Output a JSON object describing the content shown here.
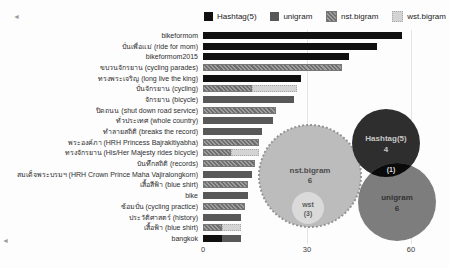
{
  "legend": [
    {
      "label": "Hashtag(5)",
      "type": "hashtag"
    },
    {
      "label": "unigram",
      "type": "unigram"
    },
    {
      "label": "nst.bigram",
      "type": "nst"
    },
    {
      "label": "wst.bigram",
      "type": "wst"
    }
  ],
  "colors": {
    "hashtag": "#101010",
    "unigram": "#585858",
    "nst": "#8f8f8f",
    "wst": "#d4d4d4"
  },
  "chart_data": {
    "type": "bar",
    "orientation": "horizontal",
    "title": "",
    "xlabel": "",
    "ylabel": "",
    "xticks": [
      "0",
      "30",
      "60"
    ],
    "xlim": [
      0,
      70
    ],
    "grid": "vertical",
    "legend_position": "top",
    "series_names": [
      "Hashtag(5)",
      "unigram",
      "nst.bigram",
      "wst.bigram"
    ],
    "rows": [
      {
        "label": "bikeformom",
        "segments": [
          {
            "series": "Hashtag(5)",
            "type": "hashtag",
            "value": 57
          }
        ]
      },
      {
        "label": "ปั่นเพื่อแม่ (ride for mom)",
        "segments": [
          {
            "series": "Hashtag(5)",
            "type": "hashtag",
            "value": 50
          }
        ]
      },
      {
        "label": "bikeformom2015",
        "segments": [
          {
            "series": "Hashtag(5)",
            "type": "hashtag",
            "value": 42
          }
        ]
      },
      {
        "label": "ขบวนจักรยาน (cycling parades)",
        "segments": [
          {
            "series": "nst.bigram",
            "type": "nst",
            "value": 40
          }
        ]
      },
      {
        "label": "ทรงพระเจริญ (long live the king)",
        "segments": [
          {
            "series": "Hashtag(5)",
            "type": "hashtag",
            "value": 28
          }
        ]
      },
      {
        "label": "ปั่นจักรยาน (cycling)",
        "segments": [
          {
            "series": "nst.bigram",
            "type": "nst",
            "value": 14
          },
          {
            "series": "wst.bigram",
            "type": "wst",
            "value": 13
          }
        ]
      },
      {
        "label": "จักรยาน (bicycle)",
        "segments": [
          {
            "series": "unigram",
            "type": "unigram",
            "value": 26
          }
        ]
      },
      {
        "label": "ปิดถนน (shut down road service)",
        "segments": [
          {
            "series": "nst.bigram",
            "type": "nst",
            "value": 21
          }
        ]
      },
      {
        "label": "ทั่วประเทศ (whole country)",
        "segments": [
          {
            "series": "unigram",
            "type": "unigram",
            "value": 20
          }
        ]
      },
      {
        "label": "ทำลายสถิติ (breaks the record)",
        "segments": [
          {
            "series": "unigram",
            "type": "unigram",
            "value": 17
          }
        ]
      },
      {
        "label": "พระองค์ภา (HRH Princess Bajrakitiyabha)",
        "segments": [
          {
            "series": "nst.bigram",
            "type": "nst",
            "value": 16
          }
        ]
      },
      {
        "label": "ทรงจักรยาน (His/Her Majesty rides bicycle)",
        "segments": [
          {
            "series": "nst.bigram",
            "type": "nst",
            "value": 8
          },
          {
            "series": "wst.bigram",
            "type": "wst",
            "value": 8
          }
        ]
      },
      {
        "label": "บันทึกสถิติ (records)",
        "segments": [
          {
            "series": "nst.bigram",
            "type": "nst",
            "value": 15
          }
        ]
      },
      {
        "label": "สมเด็จพระบรมฯ (HRH Crown Prince Maha Vajiralongkorn)",
        "segments": [
          {
            "series": "unigram",
            "type": "unigram",
            "value": 14
          }
        ]
      },
      {
        "label": "เสื้อสีฟ้า (blue shirt)",
        "segments": [
          {
            "series": "nst.bigram",
            "type": "nst",
            "value": 13
          }
        ]
      },
      {
        "label": "bike",
        "segments": [
          {
            "series": "unigram",
            "type": "unigram",
            "value": 13
          }
        ]
      },
      {
        "label": "ซ้อมปั่น (cycling practice)",
        "segments": [
          {
            "series": "nst.bigram",
            "type": "nst",
            "value": 12
          }
        ]
      },
      {
        "label": "ประวัติศาสตร์ (history)",
        "segments": [
          {
            "series": "unigram",
            "type": "unigram",
            "value": 11
          }
        ]
      },
      {
        "label": "เสื้อฟ้า (blue shirt)",
        "segments": [
          {
            "series": "nst.bigram",
            "type": "nst",
            "value": 5.5
          },
          {
            "series": "wst.bigram",
            "type": "wst",
            "value": 5.5
          }
        ]
      },
      {
        "label": "bangkok",
        "segments": [
          {
            "series": "Hashtag(5)",
            "type": "hashtag",
            "value": 5.5
          },
          {
            "series": "unigram",
            "type": "unigram",
            "value": 5.5
          }
        ]
      }
    ]
  },
  "venn": {
    "nst": {
      "label": "nst.bigram",
      "value": "6"
    },
    "wst": {
      "label": "wst",
      "value": "(3)"
    },
    "hashtag": {
      "label": "Hashtag(5)",
      "value": "4"
    },
    "unigram": {
      "label": "unigram",
      "value": "6"
    },
    "intersection": {
      "label": "(1)"
    }
  },
  "artifacts": {
    "corner_mark": "◄"
  }
}
